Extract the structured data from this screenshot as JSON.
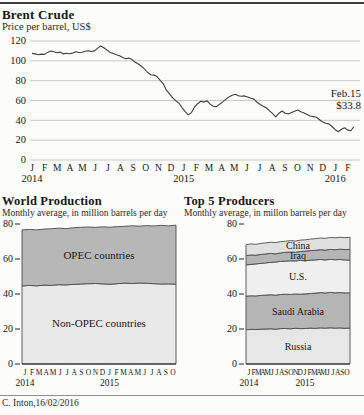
{
  "credit": "C. Inton,16/02/2016",
  "colors": {
    "background": "#fcfcfa",
    "grid": "#c8c8c8",
    "price_line": "#3f3f3f",
    "band_edge": "#4d4d4d",
    "axis": "#222222",
    "band_dark": "#b7b7b7",
    "band_light": "#e9e9e9"
  },
  "chart_data": [
    {
      "type": "line",
      "title": "Brent Crude",
      "subtitle": "Price per barrel, US$",
      "ylabel": "US$ per barrel",
      "ylim": [
        0,
        120
      ],
      "yticks": [
        0,
        20,
        40,
        60,
        80,
        100,
        120
      ],
      "grid": true,
      "annotation_date": "Feb.15",
      "annotation_price": "$33.8",
      "months": [
        "J",
        "F",
        "M",
        "A",
        "M",
        "J",
        "J",
        "A",
        "S",
        "O",
        "N",
        "D",
        "J",
        "F",
        "M",
        "A",
        "M",
        "J",
        "J",
        "A",
        "S",
        "O",
        "N",
        "D",
        "J",
        "F"
      ],
      "years": [
        {
          "label": "2014",
          "month_index": 0
        },
        {
          "label": "2015",
          "month_index": 12
        },
        {
          "label": "2016",
          "month_index": 24
        }
      ],
      "values": [
        107.5,
        107.0,
        106.2,
        106.8,
        106.5,
        108.5,
        109.8,
        109.2,
        108.2,
        108.8,
        107.0,
        107.6,
        107.2,
        107.8,
        109.2,
        108.4,
        108.6,
        109.6,
        110.2,
        109.4,
        110.0,
        112.8,
        115.0,
        113.2,
        110.8,
        108.4,
        107.4,
        106.2,
        105.2,
        103.4,
        102.0,
        102.8,
        101.2,
        98.6,
        96.8,
        94.6,
        91.8,
        88.2,
        86.0,
        85.6,
        84.2,
        80.4,
        76.8,
        70.4,
        66.8,
        62.6,
        59.8,
        57.4,
        52.6,
        48.8,
        45.6,
        47.8,
        53.4,
        56.8,
        59.2,
        58.4,
        59.6,
        56.4,
        54.2,
        53.8,
        56.2,
        58.6,
        61.2,
        63.6,
        65.2,
        66.4,
        64.8,
        64.2,
        64.6,
        63.4,
        62.2,
        61.4,
        58.2,
        56.0,
        54.2,
        52.4,
        49.6,
        46.8,
        43.6,
        47.2,
        49.4,
        47.2,
        46.4,
        47.8,
        49.2,
        50.4,
        48.6,
        47.4,
        45.8,
        44.4,
        43.8,
        43.2,
        40.6,
        38.2,
        37.0,
        36.4,
        33.8,
        30.6,
        28.4,
        31.0,
        32.6,
        30.2,
        29.4,
        33.8
      ]
    },
    {
      "type": "area",
      "title": "World Production",
      "subtitle": "Monthly average, in million barrels per day",
      "ylim": [
        0,
        80
      ],
      "yticks": [
        0,
        20,
        40,
        60,
        80
      ],
      "months": [
        "J",
        "F",
        "M",
        "A",
        "M",
        "J",
        "J",
        "A",
        "S",
        "O",
        "N",
        "D",
        "J",
        "F",
        "M",
        "A",
        "M",
        "J",
        "J",
        "A",
        "S",
        "O"
      ],
      "years": [
        {
          "label": "2014",
          "month_index": 0
        },
        {
          "label": "2015",
          "month_index": 12
        }
      ],
      "series": [
        {
          "name": "Non-OPEC countries",
          "fill": "#e9e9e9",
          "top": [
            44.6,
            44.9,
            44.7,
            45.1,
            45.0,
            45.3,
            45.2,
            45.5,
            45.7,
            45.9,
            46.0,
            45.8,
            45.6,
            45.9,
            46.2,
            46.0,
            46.3,
            46.1,
            45.9,
            45.7,
            45.8,
            45.6
          ]
        },
        {
          "name": "OPEC countries",
          "fill": "#b7b7b7",
          "top": [
            76.6,
            76.9,
            76.7,
            77.1,
            77.3,
            77.6,
            77.4,
            77.9,
            78.1,
            78.3,
            78.1,
            78.4,
            78.2,
            78.5,
            78.7,
            79.0,
            78.8,
            79.1,
            78.9,
            79.2,
            79.0,
            79.3
          ]
        }
      ]
    },
    {
      "type": "area",
      "title": "Top 5 Producers",
      "subtitle": "Monthly average, in millon barrels per day",
      "ylim": [
        0,
        80
      ],
      "yticks": [
        0,
        20,
        40,
        60,
        80
      ],
      "months": [
        "J",
        "F",
        "M",
        "A",
        "M",
        "J",
        "J",
        "A",
        "S",
        "O",
        "N",
        "D",
        "J",
        "F",
        "M",
        "A",
        "M",
        "J",
        "J",
        "A",
        "S",
        "O"
      ],
      "years": [
        {
          "label": "2014",
          "month_index": 0
        },
        {
          "label": "2015",
          "month_index": 12
        }
      ],
      "series": [
        {
          "name": "Russia",
          "fill": "#e7e7e7",
          "top": [
            19.6,
            19.8,
            19.7,
            19.9,
            20.0,
            20.1,
            19.9,
            20.2,
            20.3,
            20.1,
            20.4,
            20.2,
            20.3,
            20.5,
            20.4,
            20.6,
            20.5,
            20.7,
            20.5,
            20.6,
            20.4,
            20.5
          ]
        },
        {
          "name": "Saudi Arabia",
          "fill": "#b5b5b5",
          "top": [
            38.8,
            39.0,
            38.9,
            39.2,
            39.4,
            39.6,
            39.3,
            39.7,
            39.9,
            39.8,
            40.0,
            39.9,
            40.1,
            40.3,
            40.5,
            40.8,
            40.6,
            40.9,
            40.7,
            40.8,
            40.6,
            40.7
          ]
        },
        {
          "name": "U.S.",
          "fill": "#efefef",
          "top": [
            56.6,
            56.9,
            57.2,
            57.5,
            57.8,
            58.1,
            58.3,
            58.6,
            58.8,
            59.0,
            58.9,
            59.2,
            59.0,
            59.3,
            59.5,
            59.7,
            59.5,
            59.8,
            59.6,
            59.7,
            59.5,
            59.4
          ]
        },
        {
          "name": "Iraq",
          "fill": "#b5b5b5",
          "top": [
            62.0,
            62.3,
            62.2,
            62.6,
            62.9,
            63.2,
            63.0,
            63.5,
            63.8,
            64.0,
            63.9,
            64.3,
            64.5,
            64.8,
            65.0,
            65.3,
            65.1,
            65.5,
            65.3,
            65.6,
            65.4,
            65.5
          ]
        },
        {
          "name": "China",
          "fill": "#e0e0e0",
          "top": [
            68.2,
            68.6,
            68.4,
            68.9,
            69.2,
            69.6,
            69.4,
            69.9,
            70.2,
            70.5,
            70.3,
            70.8,
            71.0,
            71.4,
            71.6,
            72.0,
            71.8,
            72.3,
            72.1,
            72.4,
            72.2,
            72.4
          ]
        }
      ]
    }
  ]
}
